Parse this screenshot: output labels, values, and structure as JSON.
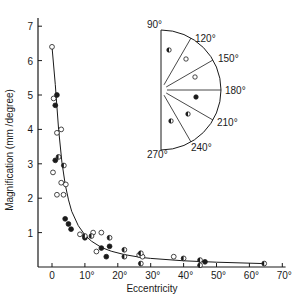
{
  "chart_data": {
    "type": "scatter",
    "title": "",
    "xlabel": "Eccentricity",
    "ylabel": "Magnification (mm /degree)",
    "xlim": [
      -3,
      72
    ],
    "ylim": [
      0,
      7.4
    ],
    "x_ticks": [
      0,
      10,
      20,
      30,
      40,
      50,
      60,
      70
    ],
    "x_tick_labels": [
      "0",
      "10°",
      "20°",
      "30°",
      "40°",
      "50°",
      "60°",
      "70°"
    ],
    "y_ticks": [
      1,
      2,
      3,
      4,
      5,
      6,
      7
    ],
    "y_tick_labels": [
      "1",
      "2",
      "3",
      "4",
      "5",
      "6",
      "7"
    ],
    "grid": false,
    "legend": "inset polar-angle semicircle (upper right) showing marker style per angular sector",
    "series": [
      {
        "name": "open circles",
        "marker": "open",
        "points": [
          [
            0,
            6.4
          ],
          [
            0.5,
            4.9
          ],
          [
            1.5,
            3.9
          ],
          [
            2.8,
            4.0
          ],
          [
            0.3,
            2.75
          ],
          [
            1.5,
            2.1
          ],
          [
            2.8,
            2.45
          ],
          [
            4.2,
            2.4
          ],
          [
            3.5,
            2.1
          ],
          [
            8.5,
            0.95
          ],
          [
            12.5,
            1.0
          ],
          [
            15,
            1.0
          ],
          [
            13.5,
            0.45
          ],
          [
            26.5,
            0.35
          ],
          [
            27.5,
            0.3
          ],
          [
            37,
            0.3
          ]
        ]
      },
      {
        "name": "filled circles",
        "marker": "filled",
        "points": [
          [
            1.5,
            5.0
          ],
          [
            1.0,
            4.7
          ],
          [
            1.0,
            3.1
          ],
          [
            4.0,
            1.4
          ],
          [
            5.0,
            1.25
          ],
          [
            5.8,
            1.1
          ],
          [
            10,
            0.85
          ],
          [
            15,
            0.55
          ],
          [
            17.5,
            0.6
          ],
          [
            16.5,
            0.3
          ],
          [
            46.5,
            0.15
          ]
        ]
      },
      {
        "name": "half-filled circles",
        "marker": "half",
        "points": [
          [
            2.0,
            3.2
          ],
          [
            3.6,
            2.95
          ],
          [
            10,
            0.9
          ],
          [
            12,
            0.9
          ],
          [
            17.5,
            0.85
          ],
          [
            22,
            0.5
          ],
          [
            22,
            0.3
          ],
          [
            27,
            0.4
          ],
          [
            27,
            0.1
          ],
          [
            40,
            0.25
          ],
          [
            45,
            0.2
          ],
          [
            45,
            0.05
          ],
          [
            64.5,
            0.1
          ]
        ]
      }
    ],
    "fit_curve": {
      "name": "hyperbolic fit",
      "points": [
        [
          0,
          6.4
        ],
        [
          1,
          5.3
        ],
        [
          2,
          4.0
        ],
        [
          3,
          3.05
        ],
        [
          4,
          2.4
        ],
        [
          5,
          1.95
        ],
        [
          6,
          1.62
        ],
        [
          8,
          1.2
        ],
        [
          10,
          0.93
        ],
        [
          12,
          0.75
        ],
        [
          15,
          0.57
        ],
        [
          18,
          0.46
        ],
        [
          22,
          0.36
        ],
        [
          27,
          0.28
        ],
        [
          30,
          0.25
        ],
        [
          40,
          0.18
        ],
        [
          50,
          0.14
        ],
        [
          64.5,
          0.1
        ]
      ]
    },
    "inset": {
      "type": "polar-semicircle",
      "angle_labels": [
        "90°",
        "120°",
        "150°",
        "180°",
        "210°",
        "240°",
        "270°"
      ],
      "sectors": [
        {
          "range": "90°-120°",
          "marker": "half"
        },
        {
          "range": "120°-150°",
          "marker": "open"
        },
        {
          "range": "150°-180°",
          "marker": "open"
        },
        {
          "range": "180°-210°",
          "marker": "filled"
        },
        {
          "range": "210°-240°",
          "marker": "half"
        },
        {
          "range": "240°-270°",
          "marker": "half"
        }
      ]
    }
  }
}
